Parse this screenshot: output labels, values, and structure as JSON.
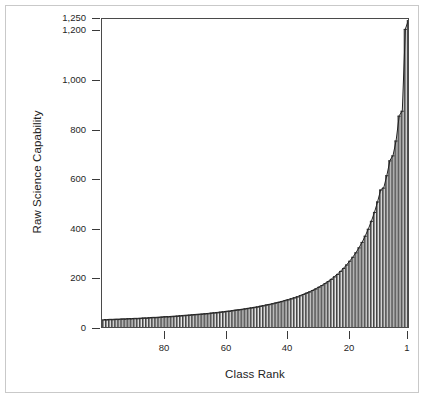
{
  "chart_data": {
    "type": "bar",
    "title": "",
    "subtitle": "",
    "xlabel": "Class Rank",
    "ylabel": "Raw Science Capability",
    "grid": false,
    "legend": "none",
    "orientation": "vertical",
    "x_axis": {
      "label": "Class Rank",
      "direction": "descending",
      "ticks": [
        80,
        60,
        40,
        20,
        1
      ],
      "tick_labels": [
        "80",
        "60",
        "40",
        "20",
        "1"
      ],
      "xlim": [
        100,
        1
      ],
      "note": "Rank 1 is the highest capability; axis runs from rank ~100 on the left down to rank 1 on the right."
    },
    "y_axis": {
      "label": "Raw Science Capability",
      "ticks": [
        0,
        200,
        400,
        600,
        800,
        1000,
        1200,
        1250
      ],
      "tick_labels": [
        "0",
        "200",
        "400",
        "600",
        "800",
        "1,000",
        "1,200",
        "1,250"
      ],
      "ylim": [
        0,
        1250
      ]
    },
    "categories": [
      100,
      99,
      98,
      97,
      96,
      95,
      94,
      93,
      92,
      91,
      90,
      89,
      88,
      87,
      86,
      85,
      84,
      83,
      82,
      81,
      80,
      79,
      78,
      77,
      76,
      75,
      74,
      73,
      72,
      71,
      70,
      69,
      68,
      67,
      66,
      65,
      64,
      63,
      62,
      61,
      60,
      59,
      58,
      57,
      56,
      55,
      54,
      53,
      52,
      51,
      50,
      49,
      48,
      47,
      46,
      45,
      44,
      43,
      42,
      41,
      40,
      39,
      38,
      37,
      36,
      35,
      34,
      33,
      32,
      31,
      30,
      29,
      28,
      27,
      26,
      25,
      24,
      23,
      22,
      21,
      20,
      19,
      18,
      17,
      16,
      15,
      14,
      13,
      12,
      11,
      10,
      9,
      8,
      7,
      6,
      5,
      4,
      3,
      2,
      1
    ],
    "values": [
      38,
      38,
      39,
      39,
      40,
      40,
      41,
      41,
      42,
      42,
      43,
      43,
      44,
      45,
      45,
      46,
      47,
      47,
      48,
      49,
      50,
      50,
      51,
      52,
      53,
      54,
      55,
      56,
      57,
      58,
      59,
      60,
      61,
      62,
      63,
      65,
      66,
      67,
      69,
      70,
      72,
      73,
      75,
      77,
      78,
      80,
      82,
      84,
      86,
      88,
      90,
      93,
      95,
      98,
      100,
      103,
      106,
      109,
      112,
      116,
      119,
      123,
      127,
      131,
      136,
      141,
      146,
      151,
      157,
      163,
      170,
      177,
      185,
      193,
      202,
      212,
      222,
      234,
      246,
      260,
      275,
      291,
      309,
      329,
      351,
      376,
      404,
      436,
      472,
      514,
      562,
      570,
      620,
      680,
      700,
      760,
      860,
      880,
      1210,
      1245
    ],
    "series": [
      {
        "name": "Raw Science Capability",
        "values": [
          38,
          38,
          39,
          39,
          40,
          40,
          41,
          41,
          42,
          42,
          43,
          43,
          44,
          45,
          45,
          46,
          47,
          47,
          48,
          49,
          50,
          50,
          51,
          52,
          53,
          54,
          55,
          56,
          57,
          58,
          59,
          60,
          61,
          62,
          63,
          65,
          66,
          67,
          69,
          70,
          72,
          73,
          75,
          77,
          78,
          80,
          82,
          84,
          86,
          88,
          90,
          93,
          95,
          98,
          100,
          103,
          106,
          109,
          112,
          116,
          119,
          123,
          127,
          131,
          136,
          141,
          146,
          151,
          157,
          163,
          170,
          177,
          185,
          193,
          202,
          212,
          222,
          234,
          246,
          260,
          275,
          291,
          309,
          329,
          351,
          376,
          404,
          436,
          472,
          514,
          562,
          570,
          620,
          680,
          700,
          760,
          860,
          880,
          1210,
          1245
        ]
      }
    ],
    "colors": {
      "bar_fill": "#8c8c8c",
      "bar_edge": "#2f2f2f",
      "axis": "#4a4a4a",
      "frame": "#c9c9c9",
      "text": "#1f1f1f"
    },
    "annotations": []
  }
}
